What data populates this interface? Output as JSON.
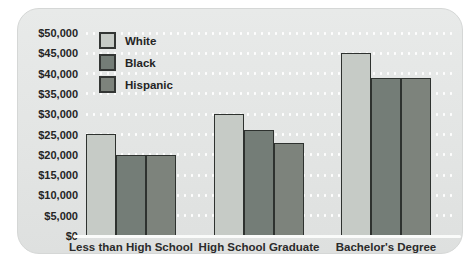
{
  "chart_data": {
    "type": "bar",
    "categories": [
      "Less than High School",
      "High School Graduate",
      "Bachelor's Degree"
    ],
    "series": [
      {
        "name": "White",
        "color": "#c6cbc6",
        "values": [
          25000,
          30000,
          45000
        ]
      },
      {
        "name": "Black",
        "color": "#747d77",
        "values": [
          20000,
          26000,
          39000
        ]
      },
      {
        "name": "Hispanic",
        "color": "#7d837c",
        "values": [
          20000,
          23000,
          39000
        ]
      }
    ],
    "title": "",
    "xlabel": "",
    "ylabel": "",
    "ylim": [
      0,
      50000
    ],
    "ytick_step": 5000,
    "y_ticks": [
      {
        "value": 0,
        "label": "$0"
      },
      {
        "value": 5000,
        "label": "$5,000"
      },
      {
        "value": 10000,
        "label": "$10,000"
      },
      {
        "value": 15000,
        "label": "$15,000"
      },
      {
        "value": 20000,
        "label": "$20,000"
      },
      {
        "value": 25000,
        "label": "$25,000"
      },
      {
        "value": 30000,
        "label": "$30,000"
      },
      {
        "value": 35000,
        "label": "$35,000"
      },
      {
        "value": 40000,
        "label": "$40,000"
      },
      {
        "value": 45000,
        "label": "$45,000"
      },
      {
        "value": 50000,
        "label": "$50,000"
      }
    ],
    "grid": "horizontal-dotted-white",
    "legend_position": "top-left",
    "colors": {
      "panel_background": "#e3e5e4",
      "page_background": "#ffffff",
      "bar_border": "#2e322f",
      "text": "#252525",
      "grid_dots": "#ffffff",
      "baseline": "#fafbfa"
    }
  }
}
